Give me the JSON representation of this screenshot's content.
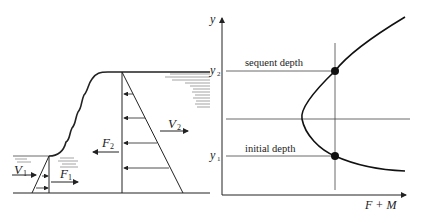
{
  "figure": {
    "left_panel": {
      "labels": {
        "v1": "V",
        "v1_sub": "1",
        "f1": "F",
        "f1_sub": "1",
        "f2": "F",
        "f2_sub": "2",
        "v2": "V",
        "v2_sub": "2"
      }
    },
    "right_panel": {
      "y_axis_label": "y",
      "x_axis_label": "F + M",
      "y2_label": "y",
      "y2_sub": "2",
      "y1_label": "y",
      "y1_sub": "1",
      "sequent_depth_label": "sequent depth",
      "initial_depth_label": "initial depth"
    }
  }
}
